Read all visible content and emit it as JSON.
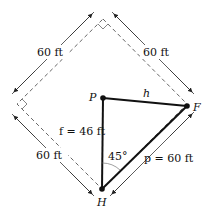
{
  "diagram": {
    "points": {
      "P": {
        "label": "P",
        "x": 103,
        "y": 98
      },
      "F": {
        "label": "F",
        "x": 187,
        "y": 106
      },
      "H": {
        "label": "H",
        "x": 102,
        "y": 189
      }
    },
    "dimensions": {
      "top_left": "60 ft",
      "top_right": "60 ft",
      "bottom_left": "60 ft"
    },
    "segments": {
      "h_label": "h",
      "f_label": "f = 46 ft",
      "p_label": "p = 60 ft"
    },
    "angle_label": "45°",
    "colors": {
      "line": "#111111",
      "dashed": "#666666",
      "dim": "#333333"
    }
  }
}
